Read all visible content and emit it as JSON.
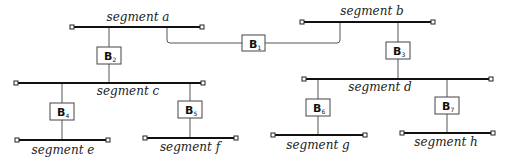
{
  "segments": {
    "a": {
      "label": "segment a"
    },
    "b": {
      "label": "segment b"
    },
    "c": {
      "label": "segment c"
    },
    "d": {
      "label": "segment d"
    },
    "e": {
      "label": "segment e"
    },
    "f": {
      "label": "segment f"
    },
    "g": {
      "label": "segment g"
    },
    "h": {
      "label": "segment h"
    }
  },
  "bridges": {
    "b1": {
      "letter": "B",
      "sub": "1",
      "connects": [
        "segment a",
        "segment b"
      ]
    },
    "b2": {
      "letter": "B",
      "sub": "2",
      "connects": [
        "segment a",
        "segment c"
      ]
    },
    "b3": {
      "letter": "B",
      "sub": "3",
      "connects": [
        "segment b",
        "segment d"
      ]
    },
    "b4": {
      "letter": "B",
      "sub": "4",
      "connects": [
        "segment c",
        "segment e"
      ]
    },
    "b5": {
      "letter": "B",
      "sub": "5",
      "connects": [
        "segment c",
        "segment f"
      ]
    },
    "b6": {
      "letter": "B",
      "sub": "6",
      "connects": [
        "segment d",
        "segment g"
      ]
    },
    "b7": {
      "letter": "B",
      "sub": "7",
      "connects": [
        "segment d",
        "segment h"
      ]
    }
  }
}
